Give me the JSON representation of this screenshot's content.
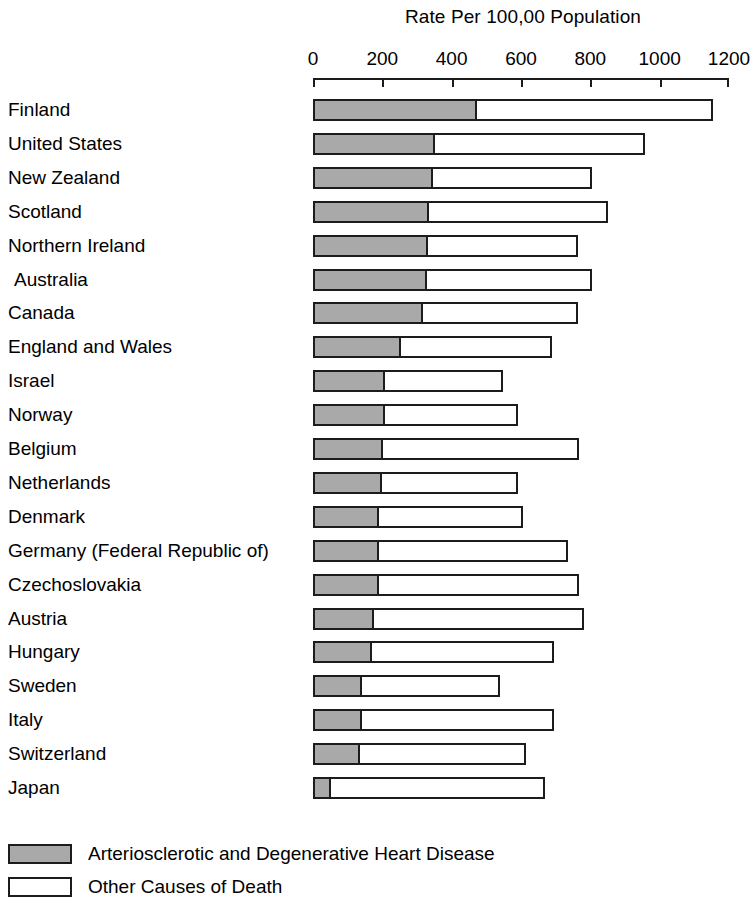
{
  "chart_data": {
    "type": "bar",
    "orientation": "horizontal",
    "stacked": true,
    "title": "Rate Per 100,00 Population",
    "xlabel": "",
    "ylabel": "",
    "xlim": [
      0,
      1200
    ],
    "xticks": [
      0,
      200,
      400,
      600,
      800,
      1000,
      1200
    ],
    "xtick_labels": [
      "0",
      "200",
      "400",
      "600",
      "800",
      "1000",
      "1200"
    ],
    "grid": false,
    "legend_position": "bottom-left",
    "categories": [
      "Finland",
      "United States",
      "New Zealand",
      "Scotland",
      "Northern Ireland",
      "Australia",
      "Canada",
      "England and Wales",
      "Israel",
      "Norway",
      "Belgium",
      "Netherlands",
      "Denmark",
      "Germany (Federal Republic of)",
      "Czechoslovakia",
      "Austria",
      "Hungary",
      "Sweden",
      "Italy",
      "Switzerland",
      "Japan"
    ],
    "series": [
      {
        "name": "Arteriosclerotic and Degenerative Heart Disease",
        "color": "#a9a9a9",
        "values": [
          468,
          347,
          341,
          330,
          327,
          324,
          312,
          249,
          202,
          202,
          197,
          194,
          185,
          185,
          185,
          171,
          165,
          136,
          136,
          130,
          46
        ]
      },
      {
        "name": "Other Causes of Death",
        "color": "#ffffff",
        "values": [
          685,
          610,
          465,
          520,
          436,
          482,
          451,
          439,
          347,
          390,
          569,
          396,
          422,
          552,
          581,
          612,
          529,
          404,
          560,
          483,
          622
        ]
      }
    ],
    "totals": [
      1153,
      957,
      806,
      850,
      763,
      806,
      763,
      688,
      549,
      592,
      766,
      590,
      607,
      737,
      766,
      783,
      694,
      540,
      696,
      613,
      668
    ]
  },
  "legend": {
    "items": [
      {
        "label": "Arteriosclerotic and Degenerative Heart Disease",
        "swatch": "#a9a9a9"
      },
      {
        "label": "Other Causes of Death",
        "swatch": "#ffffff"
      }
    ]
  },
  "colors": {
    "primary_fill": "#a9a9a9",
    "secondary_fill": "#ffffff",
    "outline": "#1c1c1c",
    "background": "#ffffff"
  }
}
